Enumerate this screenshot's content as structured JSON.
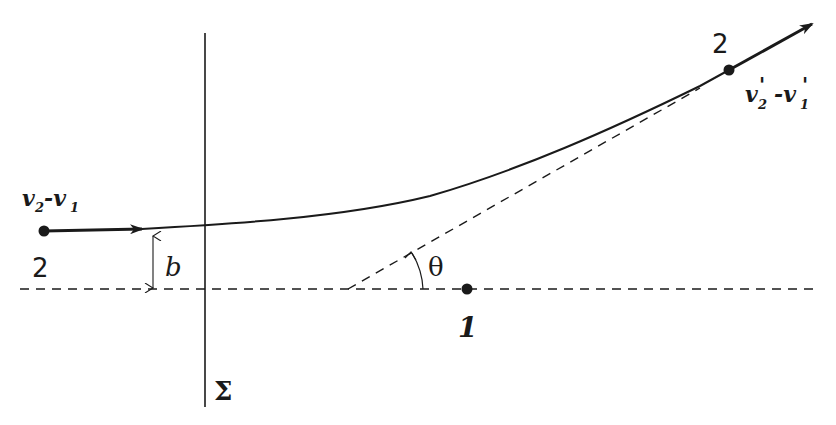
{
  "diagram": {
    "colors": {
      "ink": "#1a1a1a",
      "background": "#ffffff"
    },
    "labels": {
      "incoming_velocity_main": "v",
      "incoming_velocity_sub2": "2",
      "incoming_velocity_minus": "-v",
      "incoming_velocity_sub1": "1",
      "outgoing_velocity_main": "v",
      "outgoing_velocity_sub2": "2",
      "outgoing_velocity_prime1": "'",
      "outgoing_velocity_minus": "-v",
      "outgoing_velocity_sub1": "1",
      "outgoing_velocity_prime2": "'",
      "particle_2_start": "2",
      "particle_2_end": "2",
      "particle_1": "1",
      "impact_parameter": "b",
      "scattering_angle": "θ",
      "plane": "Σ"
    },
    "elements": [
      "vertical-plane-line-sigma",
      "horizontal-dashed-axis",
      "incoming-velocity-arrow",
      "scattering-trajectory-curve",
      "outgoing-velocity-arrow",
      "asymptote-dashed-line",
      "impact-parameter-double-arrow",
      "angle-theta-arc",
      "particle-1-point",
      "particle-2-start-point",
      "particle-2-end-point"
    ]
  }
}
